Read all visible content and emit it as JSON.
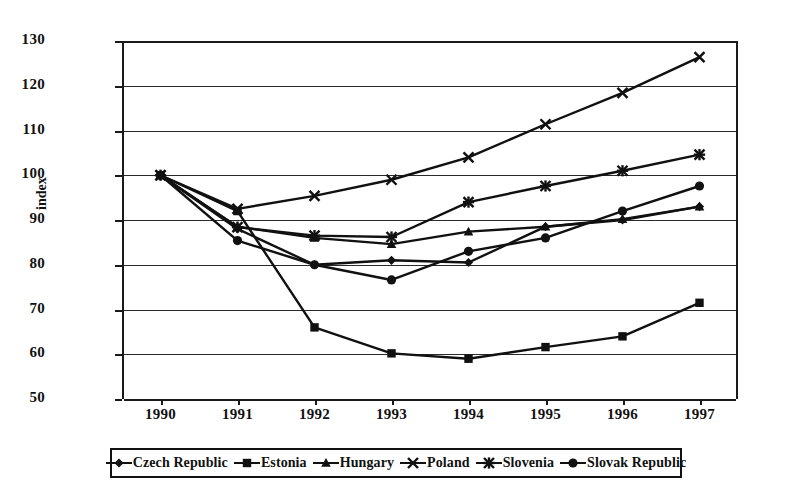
{
  "chart_data": {
    "type": "line",
    "title": "",
    "xlabel": "",
    "ylabel": "index",
    "x": [
      1990,
      1991,
      1992,
      1993,
      1994,
      1995,
      1996,
      1997
    ],
    "xticklabels": [
      "1990",
      "1991",
      "1992",
      "1993",
      "1994",
      "1995",
      "1996",
      "1997"
    ],
    "ylim": [
      50,
      130
    ],
    "yticks": [
      50,
      60,
      70,
      80,
      90,
      100,
      110,
      120,
      130
    ],
    "yticklabels": [
      "50",
      "60",
      "70",
      "80",
      "90",
      "100",
      "110",
      "120",
      "130"
    ],
    "grid": "horizontal",
    "legend_position": "bottom",
    "series": [
      {
        "name": "Czech Republic",
        "marker": "diamond",
        "values": [
          100,
          88.0,
          80.0,
          81.0,
          80.5,
          88.5,
          90.0,
          93.0
        ]
      },
      {
        "name": "Estonia",
        "marker": "square",
        "values": [
          100,
          92.0,
          66.0,
          60.2,
          59.0,
          61.6,
          64.0,
          71.5
        ]
      },
      {
        "name": "Hungary",
        "marker": "triangle",
        "values": [
          100,
          88.5,
          86.0,
          84.6,
          87.4,
          88.5,
          90.2,
          93.0
        ]
      },
      {
        "name": "Poland",
        "marker": "x",
        "values": [
          100,
          92.5,
          95.4,
          99.0,
          104.0,
          111.4,
          118.4,
          126.4
        ]
      },
      {
        "name": "Slovenia",
        "marker": "asterisk",
        "values": [
          100,
          88.4,
          86.5,
          86.2,
          94.0,
          97.6,
          101.0,
          104.6
        ]
      },
      {
        "name": "Slovak Republic",
        "marker": "circle",
        "values": [
          100,
          85.4,
          80.0,
          76.6,
          83.0,
          86.0,
          92.0,
          97.6
        ]
      }
    ]
  },
  "colors": {
    "ink": "#111111",
    "grid": "#2a2a2a",
    "background": "#ffffff"
  }
}
